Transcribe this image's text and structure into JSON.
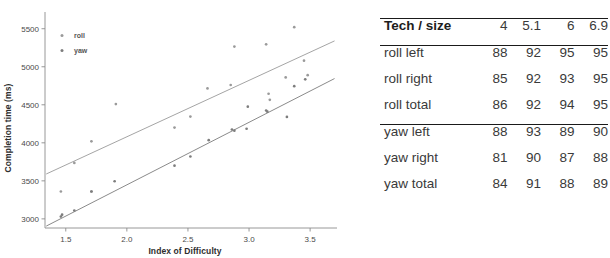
{
  "chart_data": {
    "type": "scatter",
    "title": "",
    "xlabel": "Index of Difficulty",
    "ylabel": "Completion time (ms)",
    "xlim": [
      1.33,
      3.72
    ],
    "ylim": [
      2880,
      5720
    ],
    "xticks": [
      "1.5",
      "2.0",
      "2.5",
      "3.0",
      "3.5"
    ],
    "xtick_values": [
      1.5,
      2.0,
      2.5,
      3.0,
      3.5
    ],
    "yticks": [
      "3000",
      "3500",
      "4000",
      "4500",
      "5000",
      "5500"
    ],
    "ytick_values": [
      3000,
      3500,
      4000,
      4500,
      5000,
      5500
    ],
    "grid": false,
    "legend_position": "top-left",
    "legend": [
      "roll",
      "yaw"
    ],
    "series": [
      {
        "name": "roll",
        "color": "#9a9a9a",
        "marker": "dot",
        "points": [
          [
            1.46,
            3360
          ],
          [
            1.57,
            3735
          ],
          [
            1.71,
            4020
          ],
          [
            1.71,
            3360
          ],
          [
            1.91,
            4510
          ],
          [
            2.39,
            4200
          ],
          [
            2.52,
            4345
          ],
          [
            2.66,
            4715
          ],
          [
            2.85,
            4760
          ],
          [
            2.88,
            5265
          ],
          [
            3.14,
            5295
          ],
          [
            3.16,
            4645
          ],
          [
            3.17,
            4565
          ],
          [
            3.3,
            4860
          ],
          [
            3.37,
            5520
          ],
          [
            3.45,
            5080
          ],
          [
            3.48,
            4890
          ]
        ],
        "fit_line": {
          "x": [
            1.34,
            3.7
          ],
          "y": [
            3590,
            5340
          ]
        }
      },
      {
        "name": "yaw",
        "color": "#7d7d7d",
        "marker": "dot",
        "points": [
          [
            1.46,
            3030
          ],
          [
            1.47,
            3055
          ],
          [
            1.57,
            3110
          ],
          [
            1.71,
            3360
          ],
          [
            1.9,
            3495
          ],
          [
            2.39,
            3700
          ],
          [
            2.52,
            3820
          ],
          [
            2.67,
            4035
          ],
          [
            2.86,
            4175
          ],
          [
            2.88,
            4160
          ],
          [
            2.98,
            4185
          ],
          [
            2.99,
            4475
          ],
          [
            3.14,
            4425
          ],
          [
            3.15,
            4410
          ],
          [
            3.31,
            4340
          ],
          [
            3.37,
            4745
          ],
          [
            3.46,
            4835
          ]
        ],
        "fit_line": {
          "x": [
            1.34,
            3.7
          ],
          "y": [
            2905,
            4845
          ]
        }
      }
    ]
  },
  "table": {
    "header": {
      "label": "Tech / size",
      "columns": [
        "4",
        "5.1",
        "6",
        "6.9"
      ]
    },
    "groups": [
      {
        "rows": [
          {
            "label": "roll left",
            "values": [
              "88",
              "92",
              "95",
              "95"
            ]
          },
          {
            "label": "roll right",
            "values": [
              "85",
              "92",
              "93",
              "95"
            ]
          },
          {
            "label": "roll total",
            "values": [
              "86",
              "92",
              "94",
              "95"
            ]
          }
        ]
      },
      {
        "rows": [
          {
            "label": "yaw left",
            "values": [
              "88",
              "93",
              "89",
              "90"
            ]
          },
          {
            "label": "yaw right",
            "values": [
              "81",
              "90",
              "87",
              "88"
            ]
          },
          {
            "label": "yaw total",
            "values": [
              "84",
              "91",
              "88",
              "89"
            ]
          }
        ]
      }
    ]
  },
  "colors": {
    "axis": "#8c8c8c",
    "text": "#3a3a3a",
    "rule": "#1a1a1a",
    "roll": "#9a9a9a",
    "yaw": "#7d7d7d"
  }
}
